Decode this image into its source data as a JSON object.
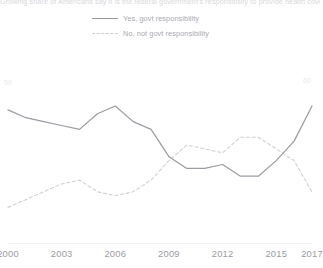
{
  "chart": {
    "title": "Growing share of Americans say it is the federal government's responsibility to provide health coverage for all",
    "legend": [
      {
        "label": "Yes, govt responsibility",
        "style": "solid",
        "color": "#9a9aa2"
      },
      {
        "label": "No, not govt responsibility",
        "style": "dashed",
        "color": "#cfcfd5"
      }
    ],
    "ticks": [
      "2000",
      "2003",
      "2006",
      "2009",
      "2012",
      "2015",
      "2017"
    ],
    "start_label": "59",
    "end_label": "60"
  },
  "chart_data": {
    "type": "line",
    "title": "Growing share of Americans say it is the federal government's responsibility to provide health coverage for all",
    "xlabel": "",
    "ylabel": "",
    "x": [
      2000,
      2001,
      2002,
      2003,
      2004,
      2005,
      2006,
      2007,
      2008,
      2009,
      2010,
      2011,
      2012,
      2013,
      2014,
      2015,
      2016,
      2017
    ],
    "xlim": [
      2000,
      2017
    ],
    "ylim": [
      30,
      70
    ],
    "grid": false,
    "legend_position": "top-center",
    "series": [
      {
        "name": "Yes, govt responsibility",
        "style": "solid",
        "color": "#9a9aa2",
        "values": [
          59,
          57,
          56,
          55,
          54,
          58,
          60,
          56,
          54,
          47,
          44,
          44,
          45,
          42,
          42,
          46,
          51,
          60
        ]
      },
      {
        "name": "No, not govt responsibility",
        "style": "dashed",
        "color": "#cfcfd5",
        "values": [
          34,
          36,
          38,
          40,
          41,
          38,
          37,
          38,
          41,
          46,
          50,
          49,
          48,
          52,
          52,
          49,
          46,
          38
        ]
      }
    ],
    "tick_labels": [
      "2000",
      "2003",
      "2006",
      "2009",
      "2012",
      "2015",
      "2017"
    ]
  }
}
